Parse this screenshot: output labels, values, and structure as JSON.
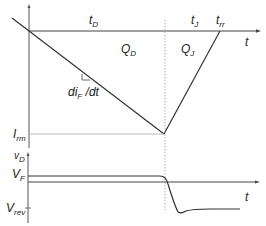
{
  "diagram": {
    "labels": {
      "tD": {
        "main": "t",
        "sub": "D"
      },
      "tJ": {
        "main": "t",
        "sub": "J"
      },
      "trr": {
        "main": "t",
        "sub": "rr"
      },
      "t_upper": {
        "main": "t",
        "sub": ""
      },
      "QD": {
        "main": "Q",
        "sub": "D"
      },
      "QJ": {
        "main": "Q",
        "sub": "J"
      },
      "slope": {
        "main": "di",
        "sub": "F",
        "tail": " /dt"
      },
      "Irm": {
        "main": "I",
        "sub": "rm"
      },
      "vD": {
        "main": "v",
        "sub": "D"
      },
      "VF": {
        "main": "V",
        "sub": "F"
      },
      "Vrev": {
        "main": "V",
        "sub": "rev"
      },
      "t_lower": {
        "main": "t",
        "sub": ""
      }
    },
    "colors": {
      "line": "#333333",
      "dotted": "#999999",
      "thin": "#aaaaaa"
    }
  }
}
